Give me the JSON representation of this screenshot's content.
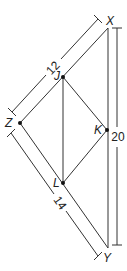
{
  "diagram": {
    "type": "geometry",
    "points": {
      "X": {
        "label": "X",
        "x": 108,
        "y": 28
      },
      "Z": {
        "label": "Z",
        "x": 20,
        "y": 123
      },
      "Y": {
        "label": "Y",
        "x": 108,
        "y": 248
      },
      "J": {
        "label": "J",
        "x": 63,
        "y": 77
      },
      "K": {
        "label": "K",
        "x": 107,
        "y": 130
      },
      "L": {
        "label": "L",
        "x": 63,
        "y": 183
      }
    },
    "segments": [
      [
        "X",
        "Z"
      ],
      [
        "Z",
        "Y"
      ],
      [
        "X",
        "Y"
      ],
      [
        "J",
        "K"
      ],
      [
        "K",
        "L"
      ],
      [
        "J",
        "L"
      ]
    ],
    "dimensions": {
      "XZ": {
        "value": "12"
      },
      "ZY": {
        "value": "14"
      },
      "XY": {
        "value": "20"
      }
    },
    "colors": {
      "stroke": "#333333",
      "text": "#222222"
    }
  }
}
